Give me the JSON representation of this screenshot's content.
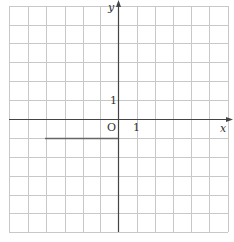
{
  "diagram": {
    "type": "coordinate-grid",
    "grid": {
      "x_min_px": 9,
      "x_max_px": 228,
      "y_min_px": 6,
      "y_max_px": 232,
      "columns": 12,
      "rows": 12,
      "x_lines": [
        9,
        28,
        46,
        65,
        83,
        100,
        118,
        137,
        155,
        173,
        191,
        209,
        228
      ],
      "y_lines": [
        6,
        25,
        43,
        62,
        81,
        100,
        119,
        138,
        157,
        176,
        195,
        213,
        232
      ],
      "line_color": "#c8c8c8"
    },
    "axes": {
      "color": "#444444",
      "origin_px": [
        118,
        119
      ],
      "x_label": "x",
      "y_label": "y",
      "origin_label": "O",
      "x_unit_label": "1",
      "y_unit_label": "1"
    },
    "segment": {
      "from_px": [
        45,
        138
      ],
      "to_px": [
        118,
        138
      ],
      "color": "#666666"
    }
  }
}
